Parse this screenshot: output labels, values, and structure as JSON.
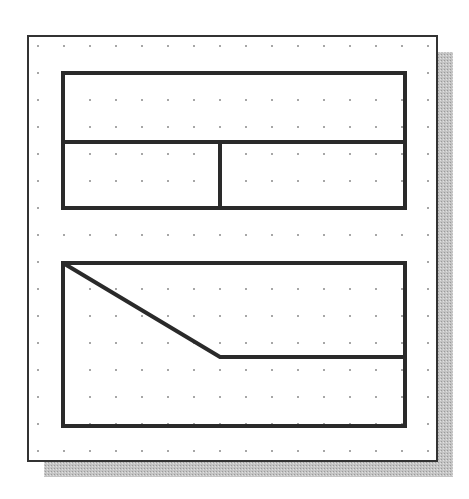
{
  "diagram": {
    "colors": {
      "background": "#ffffff",
      "paper": "#ffffff",
      "frame_stroke": "#333333",
      "shadow": "#b8b8b8",
      "line": "#2a2a2a",
      "grid_dot": "#8a8a8a"
    },
    "frame": {
      "x": 28,
      "y": 36,
      "width": 409,
      "height": 425,
      "shadow_offset": 16
    },
    "grid": {
      "x_start": 38,
      "x_step": 26,
      "cols": 16,
      "y_start": 46,
      "y_step": 27,
      "rows": 16
    },
    "shapes": {
      "top_rect": {
        "x": 63,
        "y": 73,
        "width": 342,
        "height": 135
      },
      "top_horizontal_divider": {
        "x1": 63,
        "y1": 142,
        "x2": 405,
        "y2": 142
      },
      "top_vertical_divider": {
        "x1": 220,
        "y1": 142,
        "x2": 220,
        "y2": 208
      },
      "bottom_rect": {
        "x": 63,
        "y": 263,
        "width": 342,
        "height": 163
      },
      "bottom_polyline": {
        "points": [
          [
            63,
            263
          ],
          [
            220,
            357
          ],
          [
            405,
            357
          ]
        ]
      }
    },
    "line_width": 4
  }
}
